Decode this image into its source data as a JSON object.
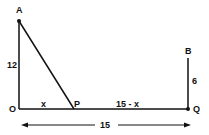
{
  "diagram": {
    "points": {
      "A": {
        "label": "A",
        "x": 19,
        "y": 21
      },
      "O": {
        "label": "O",
        "x": 19,
        "y": 109
      },
      "P": {
        "label": "P",
        "x": 74,
        "y": 109
      },
      "Q": {
        "label": "Q",
        "x": 188,
        "y": 109
      },
      "B": {
        "label": "B",
        "x": 188,
        "y": 58
      }
    },
    "segment_labels": {
      "AO": "12",
      "OP": "x",
      "PQ": "15 - x",
      "BQ": "6",
      "OQ_total": "15"
    },
    "line_color": "#111111"
  }
}
